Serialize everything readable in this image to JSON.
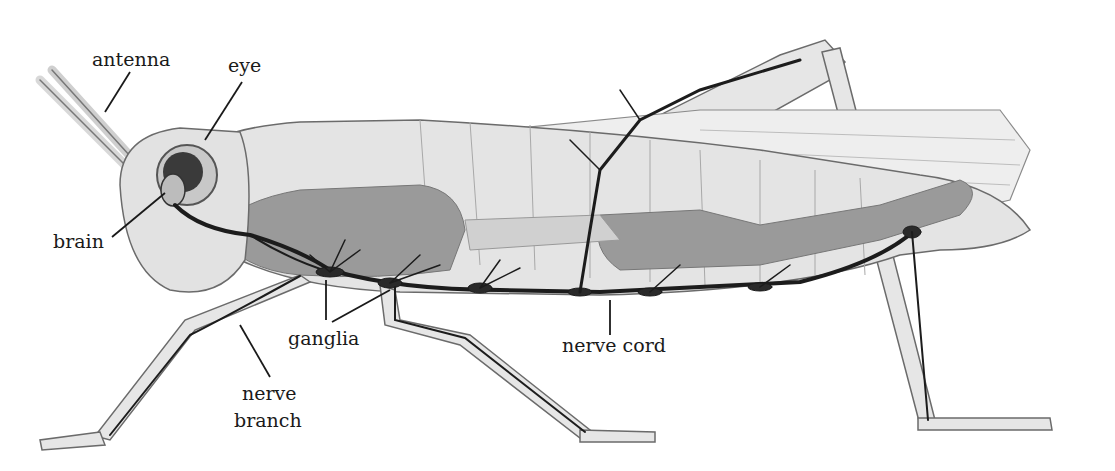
{
  "diagram": {
    "labels": {
      "antenna": "antenna",
      "eye": "eye",
      "brain": "brain",
      "ganglia": "ganglia",
      "nerve_branch_1": "nerve",
      "nerve_branch_2": "branch",
      "nerve_cord": "nerve cord"
    },
    "colors": {
      "body_fill": "#e4e4e4",
      "gut_fill": "#9a9a9a",
      "nerve": "#1c1c1c",
      "outline": "#6b6b6b",
      "label_text": "#1a1a1a"
    }
  }
}
